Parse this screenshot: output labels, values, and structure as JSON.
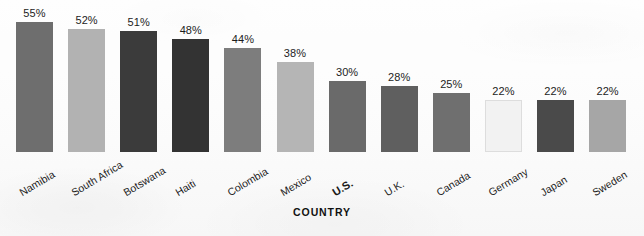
{
  "chart_data": {
    "type": "bar",
    "title": "",
    "subtitle": "",
    "xlabel": "COUNTRY",
    "ylabel": "",
    "ylim": [
      0,
      58
    ],
    "grid": false,
    "legend": null,
    "orientation": "vertical",
    "categories": [
      "Namibia",
      "South Africa",
      "Botswana",
      "Haiti",
      "Colombia",
      "Mexico",
      "U.S.",
      "U.K.",
      "Canada",
      "Germany",
      "Japan",
      "Sweden"
    ],
    "values": [
      55,
      52,
      51,
      48,
      44,
      38,
      30,
      28,
      25,
      22,
      22,
      22
    ],
    "value_labels": [
      "55%",
      "52%",
      "51%",
      "48%",
      "44%",
      "38%",
      "30%",
      "28%",
      "25%",
      "22%",
      "22%",
      "22%"
    ],
    "bar_colors": [
      "#6e6e6e",
      "#b2b2b2",
      "#3b3b3b",
      "#333333",
      "#7d7d7d",
      "#b5b5b5",
      "#6a6a6a",
      "#5f5f5f",
      "#6f6f6f",
      "#f2f2f2",
      "#4a4a4a",
      "#a6a6a6"
    ],
    "emphasized_category": "U.S.",
    "axis_title_color": "#111111",
    "background_color": "#fdfdfd"
  }
}
